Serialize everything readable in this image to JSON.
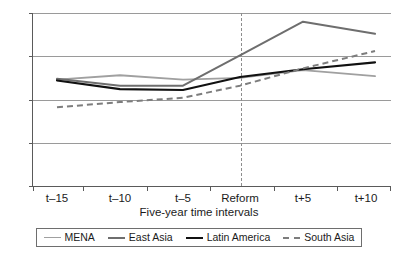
{
  "chart_data": {
    "type": "line",
    "title": "",
    "xlabel": "Five-year time intervals",
    "ylabel": "",
    "categories": [
      "t–15",
      "t–10",
      "t–5",
      "Reform",
      "t+5",
      "t+10"
    ],
    "ylim": [
      0,
      20
    ],
    "yticks": [
      0,
      5,
      10,
      15,
      20
    ],
    "ytick_labels": [
      "0",
      "5",
      "10",
      "15",
      "20"
    ],
    "grid": true,
    "legend_position": "bottom",
    "annotations": [
      {
        "name": "reform-divider",
        "type": "vertical-dashed-line",
        "at_category": "Reform"
      }
    ],
    "series": [
      {
        "name": "MENA",
        "color": "#a0a0a0",
        "style": "solid",
        "width": 1.9,
        "values": [
          12.3,
          12.8,
          12.3,
          12.5,
          13.4,
          12.7
        ]
      },
      {
        "name": "East Asia",
        "color": "#6e6e6e",
        "style": "solid",
        "width": 2.0,
        "values": [
          12.4,
          11.6,
          11.6,
          15.1,
          19.0,
          17.6
        ]
      },
      {
        "name": "Latin America",
        "color": "#111111",
        "style": "solid",
        "width": 2.2,
        "values": [
          12.2,
          11.2,
          11.1,
          12.6,
          13.5,
          14.3
        ]
      },
      {
        "name": "South Asia",
        "color": "#7d7d7d",
        "style": "dashed",
        "width": 2.0,
        "values": [
          9.1,
          9.7,
          10.2,
          11.6,
          13.6,
          15.6
        ]
      }
    ]
  },
  "axes": {
    "y_tick_labels": [
      "20",
      "15",
      "10",
      "5",
      "0"
    ],
    "x_tick_labels": [
      "t–15",
      "t–10",
      "t–5",
      "Reform",
      "t+5",
      "t+10"
    ],
    "x_axis_title": "Five-year time intervals"
  },
  "legend": {
    "items": [
      {
        "label": "MENA",
        "color": "#a0a0a0",
        "style": "solid"
      },
      {
        "label": "East Asia",
        "color": "#6e6e6e",
        "style": "solid"
      },
      {
        "label": "Latin America",
        "color": "#111111",
        "style": "solid"
      },
      {
        "label": "South Asia",
        "color": "#7d7d7d",
        "style": "dashed"
      }
    ]
  }
}
